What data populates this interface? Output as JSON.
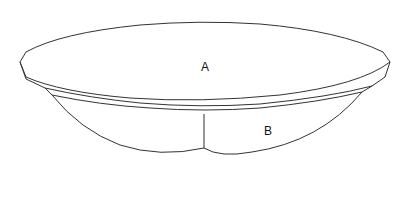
{
  "figure": {
    "type": "patent-style line drawing",
    "labels": [
      {
        "id": "A",
        "text": "A",
        "refers_to": "top surface / rim plane"
      },
      {
        "id": "B",
        "text": "B",
        "refers_to": "lower body section"
      }
    ],
    "stroke_color": "#333333",
    "background": "#ffffff"
  }
}
